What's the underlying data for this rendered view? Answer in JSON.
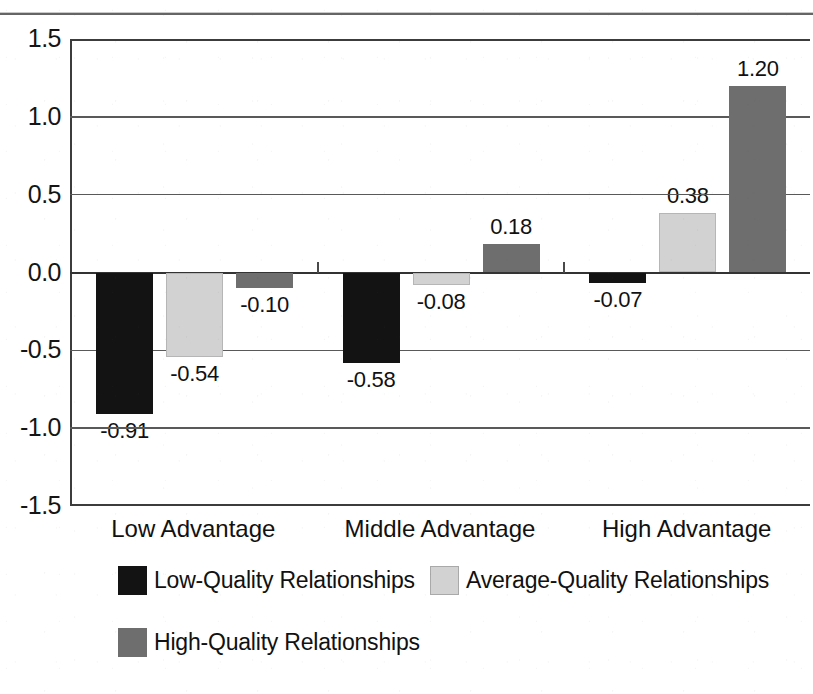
{
  "chart_data": {
    "type": "bar",
    "title": "",
    "xlabel": "",
    "ylabel": "",
    "categories": [
      "Low Advantage",
      "Middle Advantage",
      "High Advantage"
    ],
    "series": [
      {
        "name": "Low-Quality Relationships",
        "color": "#131313",
        "values": [
          -0.91,
          -0.58,
          -0.07
        ],
        "labels": [
          "-0.91",
          "-0.58",
          "-0.07"
        ]
      },
      {
        "name": "Average-Quality Relationships",
        "color": "#d2d2d2",
        "values": [
          -0.54,
          -0.08,
          0.38
        ],
        "labels": [
          "-0.54",
          "-0.08",
          "0.38"
        ]
      },
      {
        "name": "High-Quality Relationships",
        "color": "#6e6e6e",
        "values": [
          -0.1,
          0.18,
          1.2
        ],
        "labels": [
          "-0.10",
          "0.18",
          "1.20"
        ]
      }
    ],
    "ylim": [
      -1.5,
      1.5
    ],
    "ytick_labels": [
      "1.5",
      "1.0",
      "0.5",
      "0.0",
      "-0.5",
      "-1.0",
      "-1.5"
    ],
    "ytick_values": [
      1.5,
      1.0,
      0.5,
      0.0,
      -0.5,
      -1.0,
      -1.5
    ],
    "grid": true,
    "legend_position": "bottom"
  },
  "legend": {
    "items": [
      {
        "label": "Low-Quality Relationships",
        "series": 0
      },
      {
        "label": "Average-Quality Relationships",
        "series": 1
      },
      {
        "label": "High-Quality Relationships",
        "series": 2
      }
    ]
  }
}
